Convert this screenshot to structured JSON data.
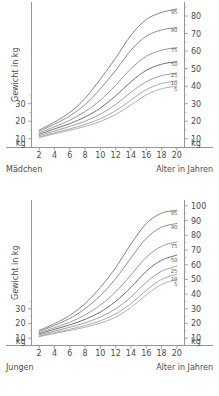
{
  "chart_data": [
    {
      "type": "line",
      "id": "girls",
      "title": "",
      "group_label": "Mädchen",
      "xlabel": "Alter in Jahren",
      "ylabel": "Gewicht in kg",
      "y_unit": "kg",
      "x": [
        2,
        4,
        6,
        8,
        10,
        12,
        14,
        16,
        18,
        20
      ],
      "xticks": [
        "2",
        "4",
        "6",
        "8",
        "10",
        "12",
        "14",
        "16",
        "18",
        "20"
      ],
      "xlim": [
        1,
        21
      ],
      "ylim": [
        5,
        88
      ],
      "left_yticks": [
        "10",
        "20",
        "30"
      ],
      "right_yticks": [
        "10",
        "20",
        "30",
        "40",
        "50",
        "60",
        "70",
        "80"
      ],
      "grid": false,
      "legend": "inline-right",
      "series": [
        {
          "name": "95",
          "label": "95",
          "color": "#6e6e6e",
          "values": [
            14.9,
            19.5,
            25.0,
            33.0,
            44.0,
            56.0,
            69.0,
            78.0,
            82.0,
            84.0
          ]
        },
        {
          "name": "90",
          "label": "90",
          "color": "#7a7a7a",
          "values": [
            14.2,
            18.3,
            23.0,
            29.5,
            38.5,
            49.0,
            60.5,
            68.5,
            72.0,
            73.5
          ]
        },
        {
          "name": "75",
          "label": "75",
          "color": "#868686",
          "values": [
            13.3,
            16.8,
            20.5,
            25.5,
            32.0,
            40.5,
            50.0,
            57.0,
            60.5,
            62.0
          ]
        },
        {
          "name": "50",
          "label": "50",
          "color": "#555555",
          "values": [
            12.5,
            15.6,
            18.6,
            22.4,
            27.5,
            34.5,
            42.5,
            49.0,
            52.5,
            54.0
          ]
        },
        {
          "name": "25",
          "label": "25",
          "color": "#8e8e8e",
          "values": [
            11.7,
            14.4,
            17.0,
            20.0,
            24.0,
            29.5,
            36.5,
            42.5,
            46.0,
            47.5
          ]
        },
        {
          "name": "10",
          "label": "10",
          "color": "#9a9a9a",
          "values": [
            11.0,
            13.4,
            15.6,
            18.2,
            21.4,
            26.0,
            32.0,
            38.0,
            41.5,
            43.0
          ]
        },
        {
          "name": "5",
          "label": "5",
          "color": "#a2a2a2",
          "values": [
            10.6,
            12.8,
            14.8,
            17.0,
            19.8,
            23.8,
            29.2,
            35.0,
            38.5,
            40.0
          ]
        }
      ]
    },
    {
      "type": "line",
      "id": "boys",
      "title": "",
      "group_label": "Jungen",
      "xlabel": "Alter in Jahren",
      "ylabel": "Gewicht in kg",
      "y_unit": "kg",
      "x": [
        2,
        4,
        6,
        8,
        10,
        12,
        14,
        16,
        18,
        20
      ],
      "xticks": [
        "2",
        "4",
        "6",
        "8",
        "10",
        "12",
        "14",
        "16",
        "18",
        "20"
      ],
      "xlim": [
        1,
        21
      ],
      "ylim": [
        5,
        104
      ],
      "left_yticks": [
        "10",
        "20",
        "30"
      ],
      "right_yticks": [
        "10",
        "20",
        "30",
        "40",
        "50",
        "60",
        "70",
        "80",
        "90",
        "100"
      ],
      "grid": false,
      "legend": "inline-right",
      "series": [
        {
          "name": "95",
          "label": "95",
          "color": "#6e6e6e",
          "values": [
            15.3,
            19.8,
            25.5,
            33.5,
            44.5,
            58.0,
            74.0,
            88.0,
            95.0,
            97.0
          ]
        },
        {
          "name": "90",
          "label": "90",
          "color": "#7a7a7a",
          "values": [
            14.6,
            18.6,
            23.4,
            30.0,
            39.0,
            50.5,
            64.5,
            78.0,
            85.5,
            88.0
          ]
        },
        {
          "name": "75",
          "label": "75",
          "color": "#868686",
          "values": [
            13.7,
            17.1,
            20.8,
            25.8,
            32.5,
            41.5,
            53.0,
            65.0,
            72.5,
            75.5
          ]
        },
        {
          "name": "50",
          "label": "50",
          "color": "#555555",
          "values": [
            12.9,
            16.0,
            19.0,
            22.8,
            27.8,
            35.0,
            44.5,
            55.5,
            63.0,
            66.5
          ]
        },
        {
          "name": "25",
          "label": "25",
          "color": "#8e8e8e",
          "values": [
            12.1,
            14.8,
            17.4,
            20.4,
            24.4,
            30.0,
            38.0,
            48.0,
            55.5,
            59.0
          ]
        },
        {
          "name": "10",
          "label": "10",
          "color": "#9a9a9a",
          "values": [
            11.4,
            13.8,
            16.0,
            18.6,
            21.8,
            26.5,
            33.5,
            42.5,
            50.0,
            53.5
          ]
        },
        {
          "name": "5",
          "label": "5",
          "color": "#a2a2a2",
          "values": [
            11.0,
            13.2,
            15.2,
            17.4,
            20.2,
            24.3,
            30.8,
            39.5,
            46.5,
            50.0
          ]
        }
      ]
    }
  ]
}
